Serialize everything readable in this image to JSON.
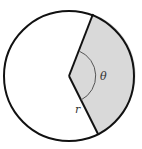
{
  "diagram": {
    "labels": {
      "angle": "θ",
      "radius": "r"
    },
    "colors": {
      "sector_fill": "#d9d9d9",
      "stroke": "#111111",
      "arc": "#555555",
      "background": "#ffffff"
    }
  }
}
